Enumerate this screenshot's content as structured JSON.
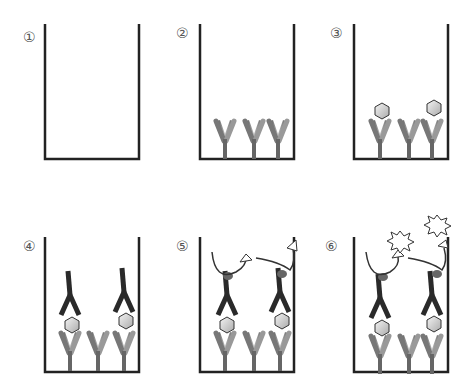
{
  "panels": [
    {
      "label": "①",
      "step": "empty well"
    },
    {
      "label": "②",
      "step": "capture antibodies coated"
    },
    {
      "label": "③",
      "step": "antigen bound"
    },
    {
      "label": "④",
      "step": "detection antibody bound"
    },
    {
      "label": "⑤",
      "step": "enzyme-linked secondary with substrate"
    },
    {
      "label": "⑥",
      "step": "signal produced"
    }
  ],
  "colors": {
    "outline": "#222222",
    "antibody_gray": "#888888",
    "antibody_dark": "#2a2a2a",
    "antigen": "#cccccc",
    "enzyme": "#666666"
  }
}
